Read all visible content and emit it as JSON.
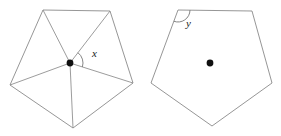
{
  "figure": {
    "background_color": "#ffffff",
    "line_color": "#8a8a8a",
    "dot_color": "#101010",
    "label_color": "#1a1a1a",
    "width": 281,
    "height": 136
  },
  "left_figure": {
    "name": "pentagon-with-center-triangulation",
    "description": "Irregular pentagon subdivided into five triangles by segments from an interior point",
    "vertices": [
      {
        "label": "A",
        "x": 43,
        "y": 10
      },
      {
        "label": "B",
        "x": 110,
        "y": 11
      },
      {
        "label": "C",
        "x": 133,
        "y": 83
      },
      {
        "label": "D",
        "x": 73,
        "y": 128
      },
      {
        "label": "E",
        "x": 10,
        "y": 85
      }
    ],
    "center_point": {
      "label": "O",
      "x": 70,
      "y": 63
    },
    "radials": [
      {
        "to": "A"
      },
      {
        "to": "B"
      },
      {
        "to": "C"
      },
      {
        "to": "D"
      },
      {
        "to": "E"
      }
    ],
    "angle_mark": {
      "label": "x",
      "at_point": "O",
      "between": [
        "B",
        "C"
      ],
      "arc_radius": 13,
      "label_x": 92,
      "label_y": 57
    }
  },
  "right_figure": {
    "name": "pentagon-with-interior-angle",
    "description": "Irregular pentagon with a marked interior angle at the top-left vertex and an interior point",
    "vertices": [
      {
        "label": "P",
        "x": 178,
        "y": 10
      },
      {
        "label": "Q",
        "x": 252,
        "y": 11
      },
      {
        "label": "R",
        "x": 272,
        "y": 83
      },
      {
        "label": "S",
        "x": 212,
        "y": 126
      },
      {
        "label": "T",
        "x": 151,
        "y": 83
      }
    ],
    "center_point": {
      "label": "M",
      "x": 210,
      "y": 63
    },
    "angle_mark": {
      "label": "y",
      "at_point": "P",
      "between": [
        "Q",
        "T"
      ],
      "arc_radius": 12,
      "label_x": 186,
      "label_y": 27
    }
  }
}
